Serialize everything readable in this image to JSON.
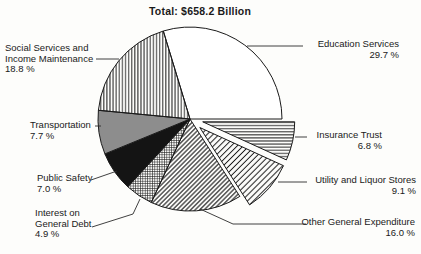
{
  "chart_data": {
    "type": "pie",
    "title": "Total:  $658.2 Billion",
    "start_angle_deg": -16.9,
    "legend_position": "labels-with-leader-lines",
    "slices": [
      {
        "label": "Education Services",
        "value": 29.7,
        "pct_text": "29.7 %",
        "pattern": "none",
        "exploded": false
      },
      {
        "label": "Insurance Trust",
        "value": 6.8,
        "pct_text": "6.8 %",
        "pattern": "horizontal-lines",
        "exploded": true
      },
      {
        "label": "Utility and Liquor Stores",
        "value": 9.1,
        "pct_text": "9.1 %",
        "pattern": "diagonal-lines-wide",
        "exploded": true
      },
      {
        "label": "Other General Expenditure",
        "value": 16.0,
        "pct_text": "16.0 %",
        "pattern": "diagonal-lines-dense",
        "exploded": false
      },
      {
        "label": "Interest on\nGeneral Debt",
        "value": 4.9,
        "pct_text": "4.9 %",
        "pattern": "fine-grid",
        "exploded": false
      },
      {
        "label": "Public Safety",
        "value": 7.0,
        "pct_text": "7.0 %",
        "pattern": "solid-black",
        "exploded": false
      },
      {
        "label": "Transportation",
        "value": 7.7,
        "pct_text": "7.7 %",
        "pattern": "solid-gray",
        "exploded": false
      },
      {
        "label": "Social Services and\nIncome Maintenance",
        "value": 18.8,
        "pct_text": "18.8 %",
        "pattern": "vertical-lines",
        "exploded": false
      }
    ],
    "colors": {
      "ink": "#1a1a1a",
      "gray_fill": "#8d8d8d",
      "black_fill": "#141414",
      "background": "#fdfdfb"
    }
  }
}
